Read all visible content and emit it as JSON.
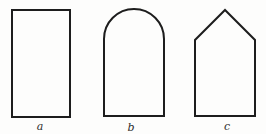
{
  "figure": {
    "background": "#fdfdfc",
    "stroke_color": "#1d1d1d",
    "label_color": "#2e2e2e",
    "shapes": [
      {
        "label": "a",
        "shape": "rectangle"
      },
      {
        "label": "b",
        "shape": "round-arch-rectangle"
      },
      {
        "label": "c",
        "shape": "pointed-pentagon"
      }
    ]
  }
}
